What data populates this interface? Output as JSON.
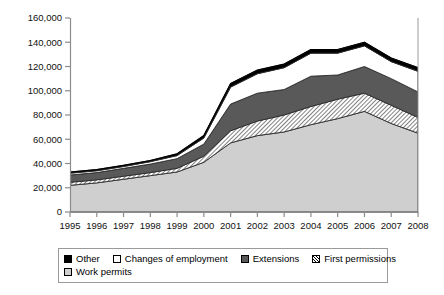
{
  "chart_data": {
    "type": "area",
    "stacked": true,
    "title": "",
    "subtitle": "",
    "xlabel": "",
    "ylabel": "",
    "grid": false,
    "legend_position": "bottom",
    "categories": [
      "1995",
      "1996",
      "1997",
      "1998",
      "1999",
      "2000",
      "2001",
      "2002",
      "2003",
      "2004",
      "2005",
      "2006",
      "2007",
      "2008"
    ],
    "x": [
      1995,
      1996,
      1997,
      1998,
      1999,
      2000,
      2001,
      2002,
      2003,
      2004,
      2005,
      2006,
      2007,
      2008
    ],
    "xlim": [
      1995,
      2008
    ],
    "ylim": [
      0,
      160000
    ],
    "ytick_labels": [
      "0",
      "20,000",
      "40,000",
      "60,000",
      "80,000",
      "100,000",
      "120,000",
      "140,000",
      "160,000"
    ],
    "ytick_values": [
      0,
      20000,
      40000,
      60000,
      80000,
      100000,
      120000,
      140000,
      160000
    ],
    "series": [
      {
        "name": "Work permits",
        "color": "#cfcfcf",
        "pattern": "solid-light-gray",
        "values": [
          22000,
          24000,
          27000,
          30000,
          33000,
          41000,
          57000,
          63000,
          66000,
          72000,
          77000,
          83000,
          73000,
          65000
        ]
      },
      {
        "name": "First permissions",
        "color": "#ffffff",
        "pattern": "diagonal-hatch",
        "values": [
          2500,
          2500,
          2500,
          2500,
          3000,
          5000,
          10000,
          12000,
          14000,
          15000,
          16000,
          15000,
          15000,
          13000
        ]
      },
      {
        "name": "Extensions",
        "color": "#595959",
        "pattern": "solid-dark-gray",
        "values": [
          6000,
          6000,
          6500,
          7000,
          8000,
          10000,
          22000,
          23000,
          21000,
          25000,
          20000,
          22000,
          22000,
          21000
        ]
      },
      {
        "name": "Changes of employment",
        "color": "#ffffff",
        "pattern": "solid-white",
        "values": [
          1500,
          1500,
          1500,
          2000,
          2500,
          5000,
          14000,
          16000,
          18000,
          19000,
          18000,
          17000,
          14000,
          17000
        ]
      },
      {
        "name": "Other",
        "color": "#000000",
        "pattern": "solid-black",
        "values": [
          1000,
          1000,
          1000,
          1000,
          1500,
          2000,
          3000,
          3000,
          3000,
          3000,
          3000,
          3000,
          3000,
          3000
        ]
      }
    ],
    "totals": [
      33000,
      35000,
      38500,
      42500,
      48000,
      63000,
      106000,
      117000,
      122000,
      134000,
      134000,
      140000,
      127000,
      119000
    ]
  },
  "legend": {
    "items": [
      {
        "label": "Other",
        "swatch": "sw-other"
      },
      {
        "label": "Changes of employment",
        "swatch": "sw-changes"
      },
      {
        "label": "Extensions",
        "swatch": "sw-ext"
      },
      {
        "label": "First permissions",
        "swatch": "sw-first"
      },
      {
        "label": "Work permits",
        "swatch": "sw-work"
      }
    ]
  }
}
